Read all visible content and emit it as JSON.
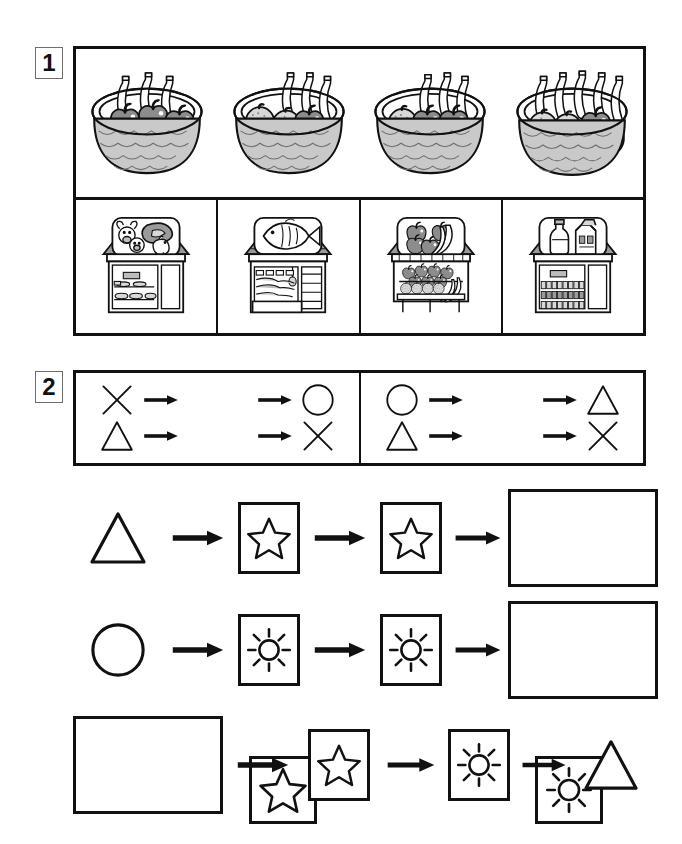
{
  "page": {
    "width": 682,
    "height": 844,
    "background_color": "#ffffff",
    "ink_color": "#111111"
  },
  "exercises": [
    {
      "number": "1",
      "badge_label": "1",
      "name": "fruit-baskets-and-shops",
      "rows": [
        {
          "name": "basket-row",
          "items": [
            {
              "name": "basket-1",
              "icon": "fruit-basket-icon",
              "apples": 5,
              "oranges": 0,
              "bananas": 3,
              "label": "Basket with 5 apples and 3 bananas"
            },
            {
              "name": "basket-2",
              "icon": "fruit-basket-icon",
              "apples": 3,
              "oranges": 3,
              "bananas": 3,
              "label": "Basket with 3 apples, 3 oranges and 3 bananas"
            },
            {
              "name": "basket-3",
              "icon": "fruit-basket-icon",
              "apples": 4,
              "oranges": 2,
              "bananas": 3,
              "label": "Basket with 4 apples, 2 oranges and 3 bananas"
            },
            {
              "name": "basket-4",
              "icon": "fruit-basket-icon",
              "apples": 3,
              "oranges": 3,
              "bananas": 5,
              "label": "Basket with 3 apples, 3 oranges and 5 bananas"
            }
          ]
        },
        {
          "name": "shop-row",
          "items": [
            {
              "name": "shop-butcher",
              "icon": "butcher-shop-icon",
              "sign": "cow, pig, chicken and steak",
              "label": "Butcher's shop"
            },
            {
              "name": "shop-fishmonger",
              "icon": "fish-shop-icon",
              "sign": "fish",
              "label": "Fishmonger's shop"
            },
            {
              "name": "shop-greengrocer",
              "icon": "greengrocer-shop-icon",
              "sign": "apples and bananas",
              "label": "Greengrocer's shop"
            },
            {
              "name": "shop-dairy",
              "icon": "dairy-shop-icon",
              "sign": "milk bottle and milk carton",
              "label": "Dairy shop"
            }
          ]
        }
      ]
    },
    {
      "number": "2",
      "badge_label": "2",
      "name": "shape-machines",
      "key": {
        "name": "machine-rules-key",
        "rules": [
          {
            "machine": "star",
            "machine_icon": "star-machine-icon",
            "mappings": [
              {
                "input": "cross",
                "input_icon": "cross-icon",
                "output": "circle",
                "output_icon": "circle-icon"
              },
              {
                "input": "triangle",
                "input_icon": "triangle-icon",
                "output": "cross",
                "output_icon": "cross-icon"
              }
            ]
          },
          {
            "machine": "sun",
            "machine_icon": "sun-machine-icon",
            "mappings": [
              {
                "input": "circle",
                "input_icon": "circle-icon",
                "output": "triangle",
                "output_icon": "triangle-icon"
              },
              {
                "input": "triangle",
                "input_icon": "triangle-icon",
                "output": "cross",
                "output_icon": "cross-icon"
              }
            ]
          }
        ]
      },
      "tasks": [
        {
          "name": "task-row-1",
          "sequence": [
            {
              "kind": "shape",
              "value": "triangle",
              "icon": "triangle-icon"
            },
            {
              "kind": "arrow",
              "icon": "arrow-right-icon"
            },
            {
              "kind": "machine",
              "value": "star",
              "icon": "star-machine-icon"
            },
            {
              "kind": "arrow",
              "icon": "arrow-right-icon"
            },
            {
              "kind": "machine",
              "value": "star",
              "icon": "star-machine-icon"
            },
            {
              "kind": "arrow",
              "icon": "arrow-right-icon"
            },
            {
              "kind": "answer",
              "value": "",
              "icon": "empty-answer-box"
            }
          ]
        },
        {
          "name": "task-row-2",
          "sequence": [
            {
              "kind": "shape",
              "value": "circle",
              "icon": "circle-icon"
            },
            {
              "kind": "arrow",
              "icon": "arrow-right-icon"
            },
            {
              "kind": "machine",
              "value": "sun",
              "icon": "sun-machine-icon"
            },
            {
              "kind": "arrow",
              "icon": "arrow-right-icon"
            },
            {
              "kind": "machine",
              "value": "sun",
              "icon": "sun-machine-icon"
            },
            {
              "kind": "arrow",
              "icon": "arrow-right-icon"
            },
            {
              "kind": "answer",
              "value": "",
              "icon": "empty-answer-box"
            }
          ]
        },
        {
          "name": "task-row-3",
          "sequence": [
            {
              "kind": "answer",
              "value": "",
              "icon": "empty-answer-box"
            },
            {
              "kind": "arrow",
              "icon": "arrow-right-icon"
            },
            {
              "kind": "machine",
              "value": "star",
              "icon": "star-machine-icon"
            },
            {
              "kind": "arrow",
              "icon": "arrow-right-icon"
            },
            {
              "kind": "machine",
              "value": "sun",
              "icon": "sun-machine-icon"
            },
            {
              "kind": "arrow",
              "icon": "arrow-right-icon"
            },
            {
              "kind": "shape",
              "value": "triangle",
              "icon": "triangle-icon"
            }
          ]
        }
      ]
    }
  ]
}
